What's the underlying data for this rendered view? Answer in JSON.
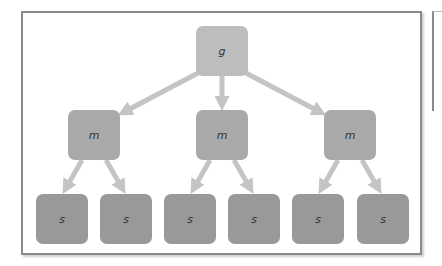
{
  "diagram": {
    "type": "tree",
    "colors": {
      "root": "#bdbdbd",
      "middle": "#a9a9a9",
      "leaf": "#999999",
      "arrow": "#c4c4c4",
      "frame": "#8a8a8a"
    },
    "root": {
      "label": "g"
    },
    "middle": [
      {
        "label": "m"
      },
      {
        "label": "m"
      },
      {
        "label": "m"
      }
    ],
    "leaves": [
      {
        "label": "s"
      },
      {
        "label": "s"
      },
      {
        "label": "s"
      },
      {
        "label": "s"
      },
      {
        "label": "s"
      },
      {
        "label": "s"
      }
    ],
    "edges": [
      [
        "g",
        "m1"
      ],
      [
        "g",
        "m2"
      ],
      [
        "g",
        "m3"
      ],
      [
        "m1",
        "s1"
      ],
      [
        "m1",
        "s2"
      ],
      [
        "m2",
        "s3"
      ],
      [
        "m2",
        "s4"
      ],
      [
        "m3",
        "s5"
      ],
      [
        "m3",
        "s6"
      ]
    ]
  }
}
